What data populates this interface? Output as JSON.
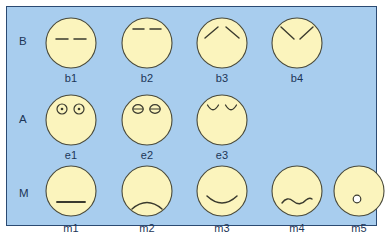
{
  "figure": {
    "panel_background": "#a8cdee",
    "panel_border": "#2b4a72",
    "face_fill": "#fbf4bd",
    "face_stroke": "#4a4a3a",
    "feature_stroke": "#3a3a2e",
    "label_color": "#1c3557",
    "rows": [
      {
        "id": "row-brows",
        "label": "B",
        "label_x": 12,
        "label_y": 28,
        "row_top": 8,
        "faces": [
          {
            "id": "b1",
            "label": "b1",
            "x": 34,
            "feature": "brows-flat-low"
          },
          {
            "id": "b2",
            "label": "b2",
            "x": 110,
            "feature": "brows-flat-raised"
          },
          {
            "id": "b3",
            "label": "b3",
            "x": 185,
            "feature": "brows-inner-up"
          },
          {
            "id": "b4",
            "label": "b4",
            "x": 260,
            "feature": "brows-inner-down"
          }
        ]
      },
      {
        "id": "row-eyes",
        "label": "A",
        "label_x": 12,
        "label_y": 106,
        "row_top": 85,
        "faces": [
          {
            "id": "e1",
            "label": "e1",
            "x": 34,
            "feature": "eyes-open-pupils"
          },
          {
            "id": "e2",
            "label": "e2",
            "x": 110,
            "feature": "eyes-half-closed"
          },
          {
            "id": "e3",
            "label": "e3",
            "x": 185,
            "feature": "eyes-closed-curved"
          }
        ]
      },
      {
        "id": "row-mouths",
        "label": "M",
        "label_x": 12,
        "label_y": 180,
        "row_top": 158,
        "faces": [
          {
            "id": "m1",
            "label": "m1",
            "x": 34,
            "feature": "mouth-straight"
          },
          {
            "id": "m2",
            "label": "m2",
            "x": 110,
            "feature": "mouth-frown"
          },
          {
            "id": "m3",
            "label": "m3",
            "x": 185,
            "feature": "mouth-smile"
          },
          {
            "id": "m4",
            "label": "m4",
            "x": 260,
            "feature": "mouth-wavy"
          },
          {
            "id": "m5",
            "label": "m5",
            "x": 322,
            "feature": "mouth-small-circle"
          }
        ]
      }
    ]
  }
}
